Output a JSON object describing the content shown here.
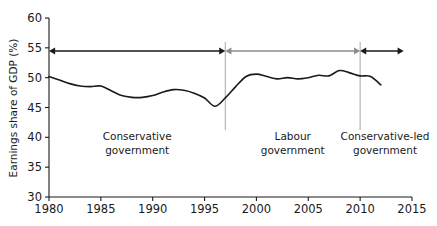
{
  "chart_data": {
    "type": "line",
    "title": "",
    "xlabel": "",
    "ylabel": "Earnings share of GDP (%)",
    "xlim": [
      1980,
      2015
    ],
    "ylim": [
      30,
      60
    ],
    "grid": false,
    "legend": "none",
    "x_ticks": [
      "1980",
      "1985",
      "1990",
      "1995",
      "2000",
      "2005",
      "2010",
      "2015"
    ],
    "x_tick_values": [
      1980,
      1985,
      1990,
      1995,
      2000,
      2005,
      2010,
      2015
    ],
    "y_ticks": [
      "30",
      "35",
      "40",
      "45",
      "50",
      "55",
      "60"
    ],
    "y_tick_values": [
      30,
      35,
      40,
      45,
      50,
      55,
      60
    ],
    "series": [
      {
        "name": "Earnings share of GDP",
        "color": "#1a1a1a",
        "x": [
          1980,
          1981,
          1982,
          1983,
          1984,
          1985,
          1986,
          1987,
          1988,
          1989,
          1990,
          1991,
          1992,
          1993,
          1994,
          1995,
          1996,
          1997,
          1998,
          1999,
          2000,
          2001,
          2002,
          2003,
          2004,
          2005,
          2006,
          2007,
          2008,
          2009,
          2010,
          2011,
          2012
        ],
        "values": [
          50.2,
          49.6,
          49.0,
          48.6,
          48.5,
          48.6,
          47.8,
          47.0,
          46.7,
          46.7,
          47.0,
          47.6,
          48.0,
          47.9,
          47.4,
          46.6,
          45.2,
          46.6,
          48.5,
          50.2,
          50.6,
          50.2,
          49.8,
          50.0,
          49.8,
          50.0,
          50.4,
          50.3,
          51.2,
          50.8,
          50.3,
          50.2,
          48.8
        ]
      }
    ],
    "annotations": [
      {
        "id": "conservative",
        "label_line1": "Conservative",
        "label_line2": "government",
        "start_year": 1980,
        "end_year": 1997,
        "arrow_color": "#1a1a1a",
        "arrow_style": "double",
        "label_center_year": 1988.5
      },
      {
        "id": "labour",
        "label_line1": "Labour",
        "label_line2": "government",
        "start_year": 1997,
        "end_year": 2010,
        "arrow_color": "#8c8c8c",
        "arrow_style": "double",
        "label_center_year": 2003.5
      },
      {
        "id": "conservative-led",
        "label_line1": "Conservative-led",
        "label_line2": "government",
        "start_year": 2010,
        "end_year": 2014.2,
        "arrow_color": "#1a1a1a",
        "arrow_style": "double",
        "label_center_year": 2012.4
      }
    ],
    "dividers": [
      {
        "year": 1997,
        "color": "#b0b0b0"
      },
      {
        "year": 2010,
        "color": "#b0b0b0"
      }
    ]
  }
}
